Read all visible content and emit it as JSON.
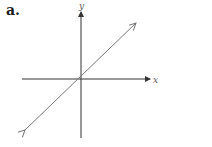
{
  "figure": {
    "label": "a.",
    "x_axis_label": "x",
    "y_axis_label": "y",
    "line": {
      "description": "straight line through origin with positive slope, arrows both ends",
      "color": "#777777"
    },
    "axis_color": "#333333"
  }
}
